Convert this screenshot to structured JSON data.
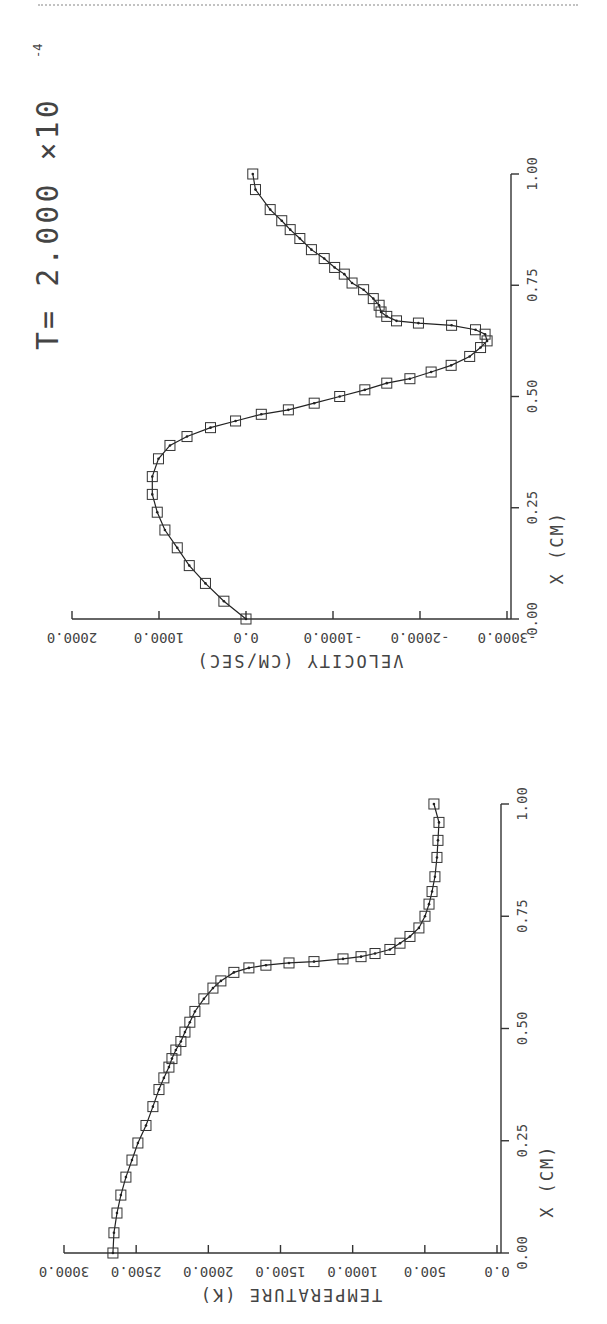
{
  "figure": {
    "time_label": "T= 2.000 ×10",
    "time_exponent": "-4"
  },
  "chart_data": [
    {
      "type": "line",
      "title": "",
      "xlabel": "X (CM)",
      "ylabel": "VELOCITY (CM/SEC)",
      "orientation": "rotated-90 (x axis vertical, value axis horizontal, labels inverted)",
      "x_ticks": [
        "0.00",
        "0.25",
        "0.50",
        "0.75",
        "1.00"
      ],
      "x_tick_values": [
        0,
        0.25,
        0.5,
        0.75,
        1.0
      ],
      "y_ticks": [
        "-3000.0",
        "-2000.0",
        "-1000.0",
        "0.0",
        "1000.0",
        "2000.0"
      ],
      "y_tick_values": [
        -3000,
        -2000,
        -1000,
        0,
        1000,
        2000
      ],
      "xlim": [
        0,
        1
      ],
      "ylim": [
        -3000,
        2000
      ],
      "marker": "square",
      "grid": false,
      "legend": [],
      "series": [
        {
          "name": "velocity",
          "x": [
            0.0,
            0.04,
            0.08,
            0.12,
            0.16,
            0.2,
            0.24,
            0.28,
            0.32,
            0.36,
            0.39,
            0.41,
            0.43,
            0.445,
            0.46,
            0.47,
            0.485,
            0.5,
            0.515,
            0.53,
            0.54,
            0.555,
            0.57,
            0.59,
            0.61,
            0.625,
            0.64,
            0.65,
            0.66,
            0.665,
            0.67,
            0.68,
            0.69,
            0.705,
            0.72,
            0.74,
            0.755,
            0.775,
            0.79,
            0.81,
            0.83,
            0.855,
            0.875,
            0.895,
            0.92,
            0.965,
            1.0
          ],
          "values": [
            0,
            254,
            466,
            652,
            790,
            932,
            1020,
            1077,
            1077,
            1006,
            874,
            678,
            408,
            120,
            -176,
            -487,
            -784,
            -1077,
            -1366,
            -1618,
            -1884,
            -2128,
            -2358,
            -2571,
            -2696,
            -2771,
            -2748,
            -2638,
            -2363,
            -1982,
            -1730,
            -1618,
            -1552,
            -1530,
            -1463,
            -1352,
            -1219,
            -1130,
            -1019,
            -899,
            -752,
            -619,
            -508,
            -411,
            -278,
            -109,
            -78
          ]
        }
      ]
    },
    {
      "type": "line",
      "title": "",
      "xlabel": "X (CM)",
      "ylabel": "TEMPERATURE (K)",
      "orientation": "rotated-90 (x axis vertical, value axis horizontal, labels inverted)",
      "x_ticks": [
        "0.00",
        "0.25",
        "0.50",
        "0.75",
        "1.00"
      ],
      "x_tick_values": [
        0,
        0.25,
        0.5,
        0.75,
        1.0
      ],
      "y_ticks": [
        "0.0",
        "500.0",
        "1000.0",
        "1500.0",
        "2000.0",
        "2500.0",
        "3000.0"
      ],
      "y_tick_values": [
        0,
        500,
        1000,
        1500,
        2000,
        2500,
        3000
      ],
      "xlim": [
        0,
        1
      ],
      "ylim": [
        0,
        3000
      ],
      "marker": "square",
      "grid": false,
      "legend": [],
      "series": [
        {
          "name": "temperature",
          "x": [
            0.0,
            0.045,
            0.089,
            0.129,
            0.169,
            0.207,
            0.245,
            0.284,
            0.326,
            0.364,
            0.39,
            0.414,
            0.433,
            0.452,
            0.471,
            0.492,
            0.514,
            0.538,
            0.566,
            0.59,
            0.606,
            0.625,
            0.635,
            0.641,
            0.646,
            0.649,
            0.655,
            0.66,
            0.667,
            0.676,
            0.69,
            0.705,
            0.724,
            0.75,
            0.777,
            0.805,
            0.838,
            0.881,
            0.919,
            0.959,
            1.0
          ],
          "values": [
            2661,
            2654,
            2633,
            2606,
            2571,
            2529,
            2488,
            2432,
            2384,
            2342,
            2308,
            2273,
            2252,
            2225,
            2190,
            2162,
            2128,
            2093,
            2031,
            1968,
            1913,
            1823,
            1719,
            1601,
            1441,
            1268,
            1067,
            942,
            845,
            742,
            672,
            603,
            541,
            499,
            471,
            450,
            430,
            416,
            409,
            402,
            437
          ]
        }
      ]
    }
  ]
}
